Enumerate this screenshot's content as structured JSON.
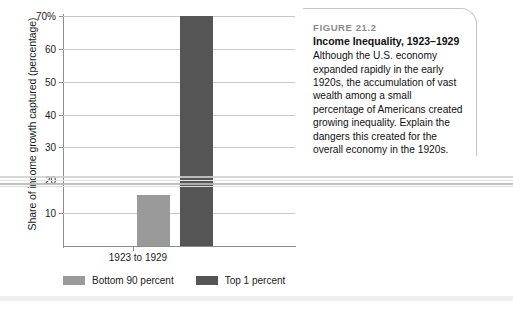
{
  "chart_data": {
    "type": "bar",
    "categories": [
      "1923 to 1929"
    ],
    "series": [
      {
        "name": "Bottom 90 percent",
        "values": [
          15.5
        ],
        "color": "#9a9a9a"
      },
      {
        "name": "Top 1 percent",
        "values": [
          70
        ],
        "color": "#555555"
      }
    ],
    "xlabel": "",
    "ylabel": "Share of income growth captured (percentage)",
    "ylim": [
      0,
      70
    ],
    "yticks": [
      70,
      60,
      50,
      40,
      30,
      20,
      10
    ],
    "ytick_labels": [
      "70%",
      "60",
      "50",
      "40",
      "30",
      "20",
      "10"
    ],
    "grid": true,
    "legend_position": "bottom"
  },
  "chart": {
    "y_axis_title": "Share of income growth captured (percentage)",
    "x_axis_label": "1923 to 1929",
    "y_ticks": [
      {
        "value": 70,
        "label": "70%"
      },
      {
        "value": 60,
        "label": "60"
      },
      {
        "value": 50,
        "label": "50"
      },
      {
        "value": 40,
        "label": "40"
      },
      {
        "value": 30,
        "label": "30"
      },
      {
        "value": 20,
        "label": "20"
      },
      {
        "value": 10,
        "label": "10"
      }
    ],
    "bars": [
      {
        "name": "bottom-90-percent",
        "value": 15.5,
        "color": "#9a9a9a"
      },
      {
        "name": "top-1-percent",
        "value": 70,
        "color": "#555555"
      }
    ],
    "legend": [
      {
        "label": "Bottom 90 percent",
        "color": "#9a9a9a"
      },
      {
        "label": "Top 1 percent",
        "color": "#555555"
      }
    ]
  },
  "caption": {
    "figure_number": "FIGURE 21.2",
    "title": "Income Inequality, 1923–1929",
    "body": "Although the U.S. economy expanded rapidly in the early 1920s, the accumulation of vast wealth among a small percentage of Americans created growing inequality. Explain the dangers this created for the overall economy in the 1920s."
  }
}
